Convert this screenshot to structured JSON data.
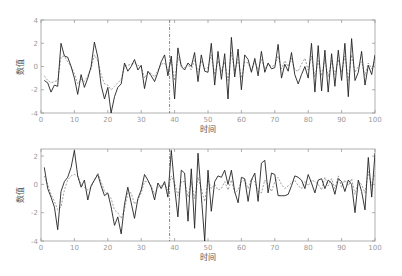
{
  "chart_data": [
    {
      "type": "line",
      "title": "",
      "xlabel": "时间",
      "ylabel": "数值",
      "xlim": [
        0,
        100
      ],
      "ylim": [
        -4,
        4
      ],
      "xticks": [
        0,
        10,
        20,
        30,
        40,
        50,
        60,
        70,
        80,
        90,
        100
      ],
      "yticks": [
        -4,
        -2,
        0,
        2,
        4
      ],
      "ytick_labels": [
        "-4",
        "-2",
        "0",
        "2",
        "4"
      ],
      "grid": false,
      "legend": null,
      "vline": {
        "x": 38.5,
        "style": "dash-dot"
      },
      "x": [
        1,
        2,
        3,
        4,
        5,
        6,
        7,
        8,
        9,
        10,
        11,
        12,
        13,
        14,
        15,
        16,
        17,
        18,
        19,
        20,
        21,
        22,
        23,
        24,
        25,
        26,
        27,
        28,
        29,
        30,
        31,
        32,
        33,
        34,
        35,
        36,
        37,
        38,
        39,
        40,
        41,
        42,
        43,
        44,
        45,
        46,
        47,
        48,
        49,
        50,
        51,
        52,
        53,
        54,
        55,
        56,
        57,
        58,
        59,
        60,
        61,
        62,
        63,
        64,
        65,
        66,
        67,
        68,
        69,
        70,
        71,
        72,
        73,
        74,
        75,
        76,
        77,
        78,
        79,
        80,
        81,
        82,
        83,
        84,
        85,
        86,
        87,
        88,
        89,
        90,
        91,
        92,
        93,
        94,
        95,
        96,
        97,
        98,
        99,
        100
      ],
      "series": [
        {
          "name": "actual",
          "style": "solid",
          "color": "#222222",
          "values": [
            -1.2,
            -1.4,
            -2.2,
            -1.6,
            -1.7,
            2.0,
            0.9,
            0.8,
            0.0,
            -1.0,
            -2.4,
            -0.7,
            -1.8,
            -1.0,
            0.0,
            2.1,
            0.8,
            -1.6,
            -2.8,
            -1.8,
            -4.0,
            -2.6,
            -1.8,
            -1.5,
            0.3,
            -0.4,
            0.0,
            0.6,
            -0.3,
            0.1,
            -1.9,
            -0.4,
            -0.8,
            -1.3,
            -0.5,
            0.4,
            1.0,
            -0.8,
            0.9,
            -2.8,
            1.6,
            0.0,
            -0.3,
            0.3,
            0.0,
            1.2,
            -1.3,
            1.0,
            -0.4,
            -0.5,
            2.0,
            -1.6,
            1.3,
            -1.1,
            1.1,
            -2.8,
            2.5,
            -0.9,
            1.5,
            -2.0,
            1.0,
            0.6,
            -0.5,
            0.7,
            -0.8,
            1.3,
            -0.5,
            0.3,
            -0.2,
            -0.1,
            1.9,
            -1.0,
            0.2,
            -0.4,
            1.2,
            -0.7,
            -1.5,
            -0.7,
            0.0,
            -1.0,
            2.0,
            -2.2,
            1.8,
            -2.1,
            1.4,
            -2.2,
            1.1,
            -1.7,
            1.4,
            -1.2,
            2.0,
            -2.6,
            2.4,
            -1.2,
            -0.5,
            1.3,
            -1.6,
            0.1,
            -0.7,
            1.0
          ]
        },
        {
          "name": "predicted",
          "style": "dashed",
          "color": "#888888",
          "values": [
            -0.8,
            -1.2,
            -1.4,
            -1.3,
            -1.2,
            0.8,
            0.9,
            0.4,
            0.0,
            -0.6,
            -1.5,
            -1.1,
            -1.3,
            -0.8,
            -0.2,
            1.0,
            0.5,
            -0.7,
            -1.5,
            -1.6,
            -2.0,
            -1.7,
            -1.4,
            -1.1,
            0.0,
            0.1,
            0.2,
            0.3,
            0.1,
            0.0,
            -1.0,
            -0.5,
            -0.6,
            -0.9,
            -0.3,
            0.2,
            0.3,
            -0.3,
            0.5,
            -1.2,
            0.8,
            0.1,
            -0.1,
            0.2,
            -0.3,
            0.6,
            -0.5,
            0.5,
            -0.2,
            -0.1,
            1.0,
            -0.7,
            0.5,
            -0.4,
            0.4,
            -1.2,
            1.2,
            -0.4,
            0.6,
            -1.0,
            0.4,
            0.3,
            -0.4,
            0.5,
            -0.3,
            0.6,
            -0.2,
            0.2,
            0.0,
            0.1,
            0.9,
            -0.2,
            0.5,
            0.0,
            0.7,
            -0.3,
            -0.4,
            0.2,
            0.7,
            -0.3,
            0.9,
            -0.9,
            0.5,
            -0.8,
            0.6,
            -0.9,
            0.5,
            -0.7,
            0.6,
            -0.5,
            0.9,
            -1.2,
            1.0,
            -0.5,
            0.0,
            0.4,
            -0.8,
            0.3,
            -0.2,
            0.4
          ]
        }
      ]
    },
    {
      "type": "line",
      "title": "",
      "xlabel": "时间",
      "ylabel": "数值",
      "xlim": [
        0,
        100
      ],
      "ylim": [
        -4,
        2.5
      ],
      "xticks": [
        0,
        10,
        20,
        30,
        40,
        50,
        60,
        70,
        80,
        90,
        100
      ],
      "yticks": [
        -4,
        -2,
        0,
        2
      ],
      "ytick_labels": [
        "-4",
        "-2",
        "0",
        "2"
      ],
      "grid": false,
      "legend": null,
      "vline": {
        "x": 38.5,
        "style": "dash-dot"
      },
      "x": [
        1,
        2,
        3,
        4,
        5,
        6,
        7,
        8,
        9,
        10,
        11,
        12,
        13,
        14,
        15,
        16,
        17,
        18,
        19,
        20,
        21,
        22,
        23,
        24,
        25,
        26,
        27,
        28,
        29,
        30,
        31,
        32,
        33,
        34,
        35,
        36,
        37,
        38,
        39,
        40,
        41,
        42,
        43,
        44,
        45,
        46,
        47,
        48,
        49,
        50,
        51,
        52,
        53,
        54,
        55,
        56,
        57,
        58,
        59,
        60,
        61,
        62,
        63,
        64,
        65,
        66,
        67,
        68,
        69,
        70,
        71,
        72,
        73,
        74,
        75,
        76,
        77,
        78,
        79,
        80,
        81,
        82,
        83,
        84,
        85,
        86,
        87,
        88,
        89,
        90,
        91,
        92,
        93,
        94,
        95,
        96,
        97,
        98,
        99,
        100
      ],
      "series": [
        {
          "name": "actual",
          "style": "solid",
          "color": "#222222",
          "values": [
            1.2,
            -0.3,
            -0.9,
            -1.6,
            -3.2,
            -0.5,
            0.2,
            0.5,
            1.2,
            2.4,
            0.6,
            -0.2,
            0.3,
            -1.1,
            -0.1,
            0.3,
            0.7,
            -0.1,
            -0.8,
            -0.6,
            -1.6,
            -2.9,
            -2.3,
            -3.5,
            -1.4,
            -0.2,
            -1.3,
            -2.4,
            -1.0,
            -0.4,
            0.7,
            0.3,
            -0.2,
            -1.1,
            0.1,
            -0.3,
            0.2,
            -0.9,
            2.4,
            -0.2,
            -2.3,
            1.0,
            0.8,
            -2.6,
            1.1,
            -3.1,
            2.2,
            -0.8,
            -4.0,
            1.0,
            -1.9,
            0.2,
            0.6,
            0.5,
            1.0,
            0.0,
            1.0,
            -0.5,
            -1.3,
            0.5,
            0.4,
            -1.2,
            0.3,
            0.8,
            -1.2,
            1.5,
            1.7,
            -0.6,
            0.8,
            0.7,
            -0.8,
            -0.8,
            -0.8,
            -0.7,
            -0.1,
            0.6,
            0.5,
            0.3,
            -0.3,
            0.7,
            0.1,
            -0.6,
            0.3,
            0.4,
            -0.3,
            0.3,
            0.1,
            -0.7,
            0.4,
            0.2,
            -0.5,
            0.3,
            0.0,
            -2.0,
            0.3,
            -0.5,
            -1.8,
            1.9,
            -0.9,
            2.2,
            -1.0
          ]
        },
        {
          "name": "predicted",
          "style": "dashed",
          "color": "#888888",
          "values": [
            0.6,
            0.0,
            -0.7,
            -1.2,
            -1.8,
            -1.6,
            -0.4,
            0.3,
            0.6,
            0.7,
            0.6,
            0.0,
            -0.2,
            -0.4,
            -0.2,
            0.3,
            0.8,
            0.2,
            -0.5,
            -0.7,
            -1.0,
            -1.8,
            -2.0,
            -2.4,
            -1.8,
            -0.6,
            -0.6,
            -1.4,
            -1.1,
            -0.6,
            0.2,
            0.2,
            -0.1,
            -0.7,
            -0.2,
            -0.1,
            0.0,
            -0.4,
            0.6,
            0.1,
            -0.8,
            0.2,
            0.2,
            -0.9,
            0.2,
            -1.0,
            0.5,
            -0.3,
            -1.2,
            0.3,
            -0.3,
            0.0,
            -0.4,
            -0.3,
            0.2,
            -0.4,
            0.3,
            -0.6,
            -0.4,
            0.2,
            0.3,
            -0.3,
            0.4,
            0.2,
            -0.5,
            -0.6,
            0.3,
            0.0,
            -0.5,
            0.2,
            0.5,
            0.0,
            -0.3,
            -0.1,
            0.1,
            0.3,
            -0.1,
            -0.3,
            0.2,
            -0.1,
            0.3,
            0.2,
            0.0,
            -0.4,
            0.5,
            -0.1,
            0.4,
            -0.3,
            0.6,
            -0.2,
            0.3,
            -0.1,
            0.4,
            -0.7,
            0.2,
            0.0,
            -0.6,
            0.9,
            -0.1,
            0.8,
            -0.2
          ]
        }
      ]
    }
  ],
  "axes_text": {
    "top": {
      "xlabel": "时间",
      "ylabel": "数值"
    },
    "bottom": {
      "xlabel": "时间",
      "ylabel": "数值"
    }
  }
}
